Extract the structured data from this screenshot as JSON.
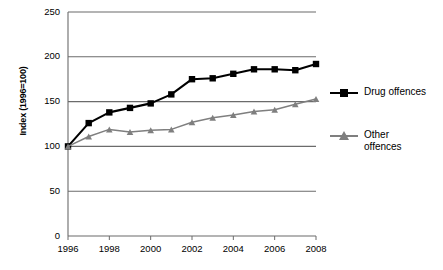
{
  "chart_data": {
    "type": "line",
    "title": "",
    "xlabel": "",
    "ylabel": "Index (1996=100)",
    "x": [
      1996,
      1997,
      1998,
      1999,
      2000,
      2001,
      2002,
      2003,
      2004,
      2005,
      2006,
      2007,
      2008
    ],
    "xtick_labels": [
      "1996",
      "1998",
      "2000",
      "2002",
      "2004",
      "2006",
      "2008"
    ],
    "xticks": [
      1996,
      1998,
      2000,
      2002,
      2004,
      2006,
      2008
    ],
    "xlim": [
      1996,
      2008
    ],
    "ytick_labels": [
      "0",
      "50",
      "100",
      "150",
      "200",
      "250"
    ],
    "yticks": [
      0,
      50,
      100,
      150,
      200,
      250
    ],
    "ylim": [
      0,
      250
    ],
    "grid": "horizontal",
    "legend_position": "right",
    "series": [
      {
        "name": "Drug offences",
        "legend_label": "Drug offences",
        "color": "#000000",
        "marker": "square",
        "values": [
          100,
          126,
          138,
          143,
          148,
          158,
          175,
          176,
          181,
          186,
          186,
          185,
          192
        ]
      },
      {
        "name": "Other offences",
        "legend_label": "Other\noffences",
        "color": "#7f7f7f",
        "marker": "triangle",
        "values": [
          100,
          111,
          119,
          116,
          118,
          119,
          127,
          132,
          135,
          139,
          141,
          147,
          153
        ]
      }
    ]
  },
  "axis": {
    "y_title": "Index (1996=100)"
  },
  "caption": {
    "partial_text": " "
  }
}
